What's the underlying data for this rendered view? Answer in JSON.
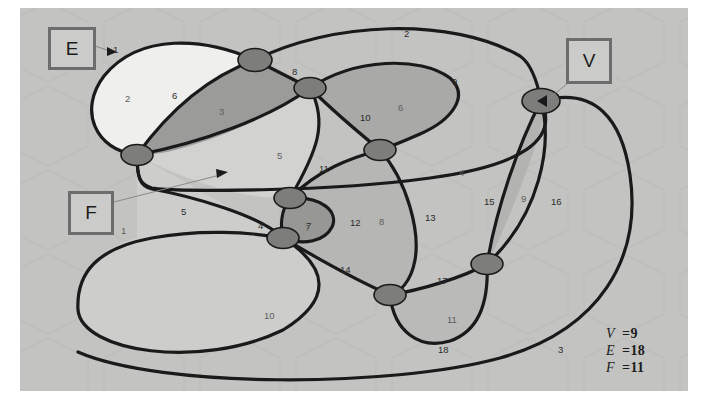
{
  "figure": {
    "type": "planar-graph-diagram",
    "background_color": "#c3c3c1",
    "stroke_color": "#1a1a1a",
    "vertex_color": "#7b7b79"
  },
  "callouts": [
    {
      "id": "E",
      "label": "E",
      "x": 48,
      "y": 27,
      "w": 42,
      "h": 37,
      "arrow_to_x": 112,
      "arrow_to_y": 52
    },
    {
      "id": "V",
      "label": "V",
      "x": 566,
      "y": 38,
      "w": 40,
      "h": 40,
      "arrow_to_x": 545,
      "arrow_to_y": 101
    },
    {
      "id": "F",
      "label": "F",
      "x": 68,
      "y": 191,
      "w": 40,
      "h": 38,
      "arrow_to_x": 224,
      "arrow_to_y": 173
    }
  ],
  "counts": {
    "V_symbol": "V",
    "V_eq": "=",
    "V_value": "9",
    "E_symbol": "E",
    "E_eq": "=",
    "E_value": "18",
    "F_symbol": "F",
    "F_eq": "=",
    "F_value": "11"
  },
  "edge_labels": [
    {
      "n": "1",
      "x": 113,
      "y": 44
    },
    {
      "n": "2",
      "x": 404,
      "y": 28
    },
    {
      "n": "3",
      "x": 558,
      "y": 344
    },
    {
      "n": "4",
      "x": 258,
      "y": 220
    },
    {
      "n": "5",
      "x": 181,
      "y": 206
    },
    {
      "n": "6",
      "x": 172,
      "y": 90
    },
    {
      "n": "7",
      "x": 306,
      "y": 220
    },
    {
      "n": "8",
      "x": 292,
      "y": 66
    },
    {
      "n": "9",
      "x": 452,
      "y": 76
    },
    {
      "n": "10",
      "x": 360,
      "y": 112
    },
    {
      "n": "11",
      "x": 319,
      "y": 163
    },
    {
      "n": "12",
      "x": 350,
      "y": 217
    },
    {
      "n": "13",
      "x": 425,
      "y": 212
    },
    {
      "n": "14",
      "x": 340,
      "y": 264
    },
    {
      "n": "15",
      "x": 484,
      "y": 196
    },
    {
      "n": "16",
      "x": 551,
      "y": 196
    },
    {
      "n": "17",
      "x": 437,
      "y": 275
    },
    {
      "n": "18",
      "x": 438,
      "y": 344
    }
  ],
  "face_labels": [
    {
      "n": "1",
      "x": 121,
      "y": 225
    },
    {
      "n": "2",
      "x": 125,
      "y": 93
    },
    {
      "n": "3",
      "x": 219,
      "y": 106
    },
    {
      "n": "4",
      "x": 459,
      "y": 167
    },
    {
      "n": "5",
      "x": 277,
      "y": 150
    },
    {
      "n": "6",
      "x": 398,
      "y": 102
    },
    {
      "n": "7",
      "x": 305,
      "y": 222
    },
    {
      "n": "8",
      "x": 379,
      "y": 216
    },
    {
      "n": "9",
      "x": 521,
      "y": 193
    },
    {
      "n": "10",
      "x": 264,
      "y": 310
    },
    {
      "n": "11",
      "x": 447,
      "y": 314
    }
  ],
  "vertices": [
    {
      "id": "v1",
      "cx": 137,
      "cy": 155,
      "rx": 15,
      "ry": 10
    },
    {
      "id": "v2",
      "cx": 255,
      "cy": 60,
      "rx": 16,
      "ry": 11
    },
    {
      "id": "v3",
      "cx": 310,
      "cy": 88,
      "rx": 15,
      "ry": 10
    },
    {
      "id": "v4",
      "cx": 380,
      "cy": 150,
      "rx": 15,
      "ry": 10
    },
    {
      "id": "v5",
      "cx": 290,
      "cy": 198,
      "rx": 15,
      "ry": 10
    },
    {
      "id": "v6",
      "cx": 283,
      "cy": 238,
      "rx": 15,
      "ry": 10
    },
    {
      "id": "v7",
      "cx": 390,
      "cy": 295,
      "rx": 15,
      "ry": 10
    },
    {
      "id": "v8",
      "cx": 487,
      "cy": 264,
      "rx": 15,
      "ry": 10
    },
    {
      "id": "v9",
      "cx": 541,
      "cy": 101,
      "rx": 18,
      "ry": 12
    }
  ],
  "region_fills": {
    "face_2_white": "#eeeeec",
    "face_3_dark": "#9a9a98",
    "face_6_mid": "#a8a8a6",
    "face_5_light": "#cfcfcd",
    "face_7_dark": "#969694",
    "face_8_mid": "#b4b4b2",
    "face_9_mid": "#b2b2b0",
    "face_11_mid": "#b9b9b7",
    "face_10_light": "#cdcdcb",
    "face_4_light": "#c6c6c4",
    "face_1_outer": "#c3c3c1"
  }
}
